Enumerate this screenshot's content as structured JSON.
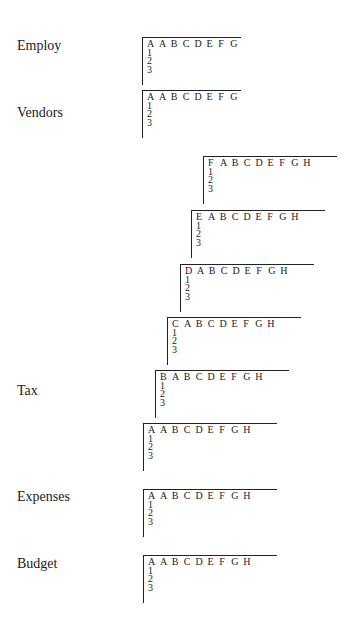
{
  "labels": {
    "employ": "Employ",
    "vendors": "Vendors",
    "tax": "Tax",
    "expenses": "Expenses",
    "budget": "Budget"
  },
  "sheets": {
    "employ": {
      "sheet_letter": "A",
      "columns": [
        "A",
        "B",
        "C",
        "D",
        "E",
        "F",
        "G"
      ],
      "rows": [
        "1",
        "2",
        "3"
      ]
    },
    "vendors": {
      "sheet_letter": "A",
      "columns": [
        "A",
        "B",
        "C",
        "D",
        "E",
        "F",
        "G"
      ],
      "rows": [
        "1",
        "2",
        "3"
      ]
    },
    "tax_f": {
      "sheet_letter": "F",
      "columns": [
        "A",
        "B",
        "C",
        "D",
        "E",
        "F",
        "G",
        "H"
      ],
      "rows": [
        "1",
        "2",
        "3"
      ]
    },
    "tax_e": {
      "sheet_letter": "E",
      "columns": [
        "A",
        "B",
        "C",
        "D",
        "E",
        "F",
        "G",
        "H"
      ],
      "rows": [
        "1",
        "2",
        "3"
      ]
    },
    "tax_d": {
      "sheet_letter": "D",
      "columns": [
        "A",
        "B",
        "C",
        "D",
        "E",
        "F",
        "G",
        "H"
      ],
      "rows": [
        "1",
        "2",
        "3"
      ]
    },
    "tax_c": {
      "sheet_letter": "C",
      "columns": [
        "A",
        "B",
        "C",
        "D",
        "E",
        "F",
        "G",
        "H"
      ],
      "rows": [
        "1",
        "2",
        "3"
      ]
    },
    "tax_b": {
      "sheet_letter": "B",
      "columns": [
        "A",
        "B",
        "C",
        "D",
        "E",
        "F",
        "G",
        "H"
      ],
      "rows": [
        "1",
        "2",
        "3"
      ]
    },
    "tax_a": {
      "sheet_letter": "A",
      "columns": [
        "A",
        "B",
        "C",
        "D",
        "E",
        "F",
        "G",
        "H"
      ],
      "rows": [
        "1",
        "2",
        "3"
      ]
    },
    "expenses": {
      "sheet_letter": "A",
      "columns": [
        "A",
        "B",
        "C",
        "D",
        "E",
        "F",
        "G",
        "H"
      ],
      "rows": [
        "1",
        "2",
        "3"
      ]
    },
    "budget": {
      "sheet_letter": "A",
      "columns": [
        "A",
        "B",
        "C",
        "D",
        "E",
        "F",
        "G",
        "H"
      ],
      "rows": [
        "1",
        "2",
        "3"
      ]
    }
  }
}
